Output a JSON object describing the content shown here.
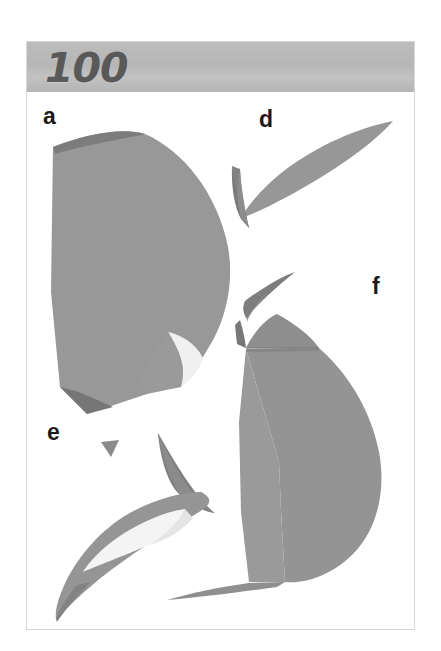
{
  "page": {
    "number": "100",
    "band_color": "#b8b8b8",
    "background": "#ffffff",
    "border_color": "#d8d8d8"
  },
  "palette": {
    "fill_mid": "#969696",
    "fill_dark": "#7e7e7e",
    "fill_darker": "#717171",
    "fill_light": "#f2f2f2",
    "label_color": "#1a1a1a",
    "number_color": "#595959"
  },
  "panels": [
    {
      "id": "a",
      "label": "a",
      "description": "large fan-shaped valve with curved right margin, darker rim along top edge, pale notch at lower right and dark beak at lower left"
    },
    {
      "id": "d",
      "label": "d",
      "description": "slender crescent blade sweeping to upper right with small dark flare to the lower left"
    },
    {
      "id": "e",
      "label": "e",
      "description": "hooked crescent with pale inner field and a separate dark spine above right"
    },
    {
      "id": "f",
      "label": "f",
      "description": "broad rounded valve with thin curved process at the top left and a narrow pointed spur at lower left"
    }
  ],
  "figure": {
    "caption_number": "100",
    "shape_count": 4
  }
}
